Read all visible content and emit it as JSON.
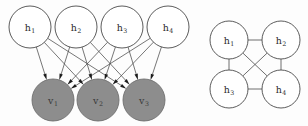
{
  "figure": {
    "background_color": "#fdfdfd",
    "width": 308,
    "height": 126
  },
  "colors": {
    "hidden_node_fill": "#ffffff",
    "visible_node_fill": "#8d8d8d",
    "node_stroke": "#4a4a4a",
    "edge_stroke": "#4a4a4a",
    "arrow_fill": "#1c1c1c",
    "label_color": "#2a2a2a"
  },
  "left_panel": {
    "name": "bipartite-directed-graph",
    "hidden_nodes": [
      {
        "id": "h1",
        "base": "h",
        "sub": "1",
        "cx": 30,
        "cy": 27,
        "r": 21,
        "filled": false
      },
      {
        "id": "h2",
        "base": "h",
        "sub": "2",
        "cx": 76,
        "cy": 27,
        "r": 21,
        "filled": false
      },
      {
        "id": "h3",
        "base": "h",
        "sub": "3",
        "cx": 122,
        "cy": 27,
        "r": 21,
        "filled": false
      },
      {
        "id": "h4",
        "base": "h",
        "sub": "4",
        "cx": 168,
        "cy": 27,
        "r": 21,
        "filled": false
      }
    ],
    "visible_nodes": [
      {
        "id": "v1",
        "base": "v",
        "sub": "1",
        "cx": 53,
        "cy": 100,
        "r": 21,
        "filled": true
      },
      {
        "id": "v2",
        "base": "v",
        "sub": "2",
        "cx": 98,
        "cy": 100,
        "r": 21,
        "filled": true
      },
      {
        "id": "v3",
        "base": "v",
        "sub": "3",
        "cx": 144,
        "cy": 100,
        "r": 21,
        "filled": true
      }
    ],
    "edges": [
      {
        "from": "h1",
        "to": "v1",
        "directed": true
      },
      {
        "from": "h1",
        "to": "v2",
        "directed": true
      },
      {
        "from": "h1",
        "to": "v3",
        "directed": true
      },
      {
        "from": "h2",
        "to": "v1",
        "directed": true
      },
      {
        "from": "h2",
        "to": "v2",
        "directed": true
      },
      {
        "from": "h2",
        "to": "v3",
        "directed": true
      },
      {
        "from": "h3",
        "to": "v1",
        "directed": true
      },
      {
        "from": "h3",
        "to": "v2",
        "directed": true
      },
      {
        "from": "h3",
        "to": "v3",
        "directed": true
      },
      {
        "from": "h4",
        "to": "v1",
        "directed": true
      },
      {
        "from": "h4",
        "to": "v2",
        "directed": true
      },
      {
        "from": "h4",
        "to": "v3",
        "directed": true
      }
    ]
  },
  "right_panel": {
    "name": "complete-undirected-graph",
    "nodes": [
      {
        "id": "rh1",
        "base": "h",
        "sub": "1",
        "cx": 229,
        "cy": 40,
        "r": 19,
        "filled": false
      },
      {
        "id": "rh2",
        "base": "h",
        "sub": "2",
        "cx": 281,
        "cy": 40,
        "r": 19,
        "filled": false
      },
      {
        "id": "rh3",
        "base": "h",
        "sub": "3",
        "cx": 229,
        "cy": 89,
        "r": 19,
        "filled": false
      },
      {
        "id": "rh4",
        "base": "h",
        "sub": "4",
        "cx": 281,
        "cy": 89,
        "r": 19,
        "filled": false
      }
    ],
    "edges": [
      {
        "from": "rh1",
        "to": "rh2",
        "directed": false
      },
      {
        "from": "rh3",
        "to": "rh4",
        "directed": false
      },
      {
        "from": "rh1",
        "to": "rh3",
        "directed": false
      },
      {
        "from": "rh2",
        "to": "rh4",
        "directed": false
      },
      {
        "from": "rh1",
        "to": "rh4",
        "directed": false
      },
      {
        "from": "rh2",
        "to": "rh3",
        "directed": false
      }
    ]
  }
}
